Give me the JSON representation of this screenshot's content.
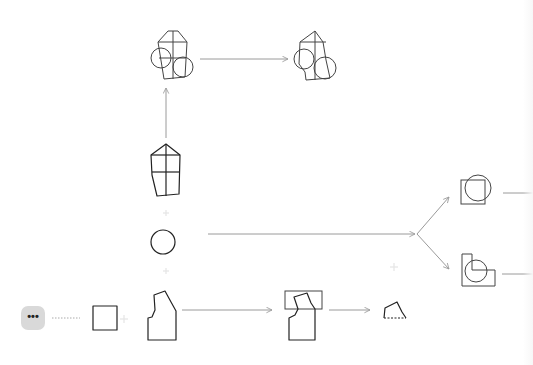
{
  "diagram": {
    "more_button": {
      "label": "•••",
      "icon": "more-horizontal-icon"
    },
    "nodes": [
      {
        "id": "bodice-block",
        "icon": "bodice-block-icon"
      },
      {
        "id": "bodice-with-circles",
        "icon": "bodice-circles-icon"
      },
      {
        "id": "bodice-rounded-circles",
        "icon": "rounded-bodice-circles-icon"
      },
      {
        "id": "circle",
        "icon": "circle-icon"
      },
      {
        "id": "square",
        "icon": "square-icon"
      },
      {
        "id": "bodice-front",
        "icon": "bodice-front-icon"
      },
      {
        "id": "bodice-in-rect",
        "icon": "bodice-rect-overlay-icon"
      },
      {
        "id": "shoulder-piece",
        "icon": "shoulder-piece-icon"
      },
      {
        "id": "square-circle-union",
        "icon": "square-circle-union-icon"
      },
      {
        "id": "l-shape-circle",
        "icon": "l-shape-circle-icon"
      }
    ],
    "colors": {
      "stroke": "#222222",
      "arrow": "#9a9a9a",
      "plus": "#e4e4e4",
      "button_bg": "#d9d9d9"
    }
  }
}
